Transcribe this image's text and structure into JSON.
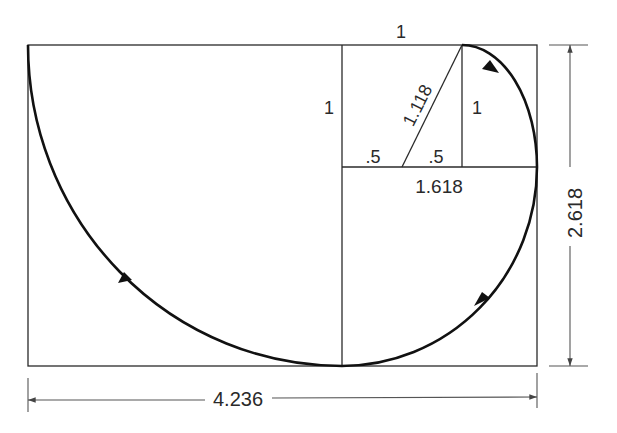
{
  "diagram": {
    "labels": {
      "top_side": "1",
      "left_side": "1",
      "inner_vertical": "1",
      "diagonal": "1.118",
      "half_left": ".5",
      "half_right": ".5",
      "golden_width": "1.618",
      "height_dimension": "2.618",
      "width_dimension": "4.236"
    },
    "colors": {
      "line": "#2a2a2a",
      "spiral": "#111111",
      "background": "#ffffff"
    }
  }
}
